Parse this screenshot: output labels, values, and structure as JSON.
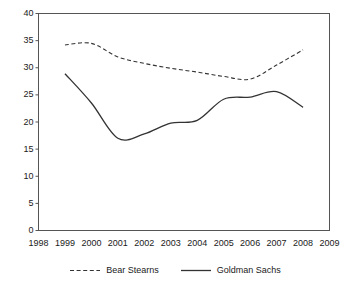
{
  "chart_data": {
    "type": "line",
    "title": "",
    "subtitle": "",
    "xlabel": "",
    "ylabel": "",
    "xlim": [
      1998,
      2009
    ],
    "ylim": [
      0,
      40
    ],
    "grid": false,
    "legend_position": "bottom",
    "x": [
      1999,
      2000,
      2001,
      2002,
      2003,
      2004,
      2005,
      2006,
      2007,
      2008
    ],
    "xtick_labels": [
      "1998",
      "1999",
      "2000",
      "2001",
      "2002",
      "2003",
      "2004",
      "2005",
      "2006",
      "2007",
      "2008",
      "2009"
    ],
    "ytick_labels": [
      "0",
      "5",
      "10",
      "15",
      "20",
      "25",
      "30",
      "35",
      "40"
    ],
    "ytick_values": [
      0,
      5,
      10,
      15,
      20,
      25,
      30,
      35,
      40
    ],
    "series": [
      {
        "name": "Bear Stearns",
        "style": "dashed",
        "color": "#333333",
        "values": [
          34.2,
          34.5,
          32.0,
          30.8,
          29.9,
          29.2,
          28.4,
          27.9,
          30.5,
          33.3
        ]
      },
      {
        "name": "Goldman Sachs",
        "style": "solid",
        "color": "#333333",
        "values": [
          28.9,
          23.5,
          17.0,
          17.8,
          19.8,
          20.3,
          24.2,
          24.6,
          25.6,
          22.7
        ]
      }
    ]
  },
  "axes": {
    "frame_color": "#555555"
  }
}
